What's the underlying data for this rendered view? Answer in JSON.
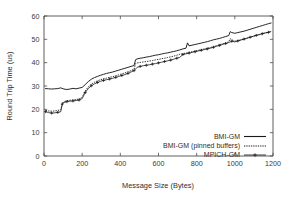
{
  "chart_data": {
    "type": "line",
    "title": "",
    "xlabel": "Message Size (Bytes)",
    "ylabel": "Round Trip Time (us)",
    "xlim": [
      0,
      1200
    ],
    "ylim": [
      0,
      60
    ],
    "xticks": [
      0,
      200,
      400,
      600,
      800,
      1000,
      1200
    ],
    "yticks": [
      0,
      10,
      20,
      30,
      40,
      50,
      60
    ],
    "xtick_labels": [
      "0",
      "200",
      "400",
      "600",
      "800",
      "1000",
      "1200"
    ],
    "ytick_labels": [
      "0",
      "10",
      "20",
      "30",
      "40",
      "50",
      "60"
    ],
    "grid": false,
    "legend_position": "lower right",
    "series": [
      {
        "name": "BMI-GM",
        "style": "solid",
        "marker": "none",
        "x": [
          8,
          24,
          40,
          56,
          72,
          88,
          104,
          120,
          136,
          152,
          168,
          184,
          200,
          216,
          232,
          248,
          264,
          280,
          296,
          312,
          328,
          344,
          360,
          376,
          392,
          408,
          424,
          440,
          456,
          472,
          480,
          488,
          504,
          520,
          536,
          552,
          568,
          584,
          600,
          616,
          632,
          648,
          664,
          680,
          696,
          712,
          728,
          744,
          752,
          760,
          776,
          792,
          808,
          824,
          840,
          856,
          872,
          888,
          904,
          920,
          936,
          952,
          968,
          976,
          984,
          1000,
          1016,
          1032,
          1048,
          1064,
          1080,
          1096,
          1112,
          1128,
          1144,
          1160,
          1176,
          1190
        ],
        "y": [
          28.9,
          28.8,
          28.7,
          28.8,
          28.9,
          29.2,
          28.7,
          28.5,
          28.7,
          29.0,
          28.8,
          29.1,
          29.4,
          30.6,
          31.9,
          32.9,
          33.6,
          34.1,
          34.6,
          35.0,
          35.4,
          35.7,
          36.0,
          36.4,
          36.8,
          37.2,
          37.6,
          38.0,
          38.4,
          38.8,
          41.3,
          41.6,
          41.9,
          42.1,
          42.4,
          42.6,
          42.9,
          43.2,
          43.4,
          43.7,
          44.0,
          44.2,
          44.5,
          44.8,
          45.1,
          45.5,
          45.9,
          46.2,
          48.5,
          47.2,
          47.5,
          47.8,
          48.1,
          48.4,
          48.7,
          49.0,
          49.4,
          49.8,
          50.1,
          50.4,
          50.8,
          51.2,
          51.6,
          53.3,
          52.9,
          52.6,
          52.9,
          53.2,
          53.5,
          53.9,
          54.3,
          54.7,
          55.1,
          55.5,
          55.9,
          56.3,
          56.7,
          57.0
        ]
      },
      {
        "name": "BMI-GM (pinned buffers)",
        "style": "dotted",
        "marker": "none",
        "x": [
          8,
          24,
          40,
          56,
          72,
          88,
          96,
          104,
          120,
          136,
          152,
          168,
          184,
          200,
          216,
          232,
          248,
          264,
          280,
          296,
          312,
          328,
          344,
          360,
          376,
          392,
          408,
          424,
          440,
          456,
          472,
          480,
          488,
          504,
          520,
          536,
          552,
          568,
          584,
          600,
          616,
          632,
          648,
          664,
          680,
          696,
          712,
          728,
          744,
          760,
          776,
          792,
          808,
          824,
          840,
          856,
          872,
          888,
          904,
          920,
          936,
          952,
          968,
          976,
          984,
          1000,
          1016,
          1032,
          1048,
          1064,
          1080,
          1096,
          1112,
          1128,
          1144,
          1160,
          1176,
          1190
        ],
        "y": [
          19.6,
          19.3,
          19.2,
          19.3,
          19.5,
          19.9,
          22.6,
          23.3,
          23.7,
          23.9,
          24.0,
          24.2,
          24.4,
          25.2,
          27.9,
          29.6,
          30.8,
          31.6,
          32.2,
          32.7,
          33.1,
          33.4,
          33.7,
          34.0,
          34.4,
          34.8,
          35.2,
          35.6,
          36.1,
          36.6,
          37.2,
          39.6,
          39.9,
          40.1,
          40.3,
          40.5,
          40.7,
          40.9,
          41.2,
          41.4,
          41.7,
          41.9,
          42.2,
          42.5,
          42.8,
          43.2,
          43.6,
          43.9,
          44.1,
          44.4,
          44.7,
          45.0,
          45.3,
          45.6,
          45.9,
          46.2,
          46.5,
          46.9,
          47.3,
          47.7,
          48.1,
          48.5,
          48.9,
          50.3,
          49.8,
          49.2,
          49.5,
          49.8,
          50.1,
          50.5,
          50.9,
          51.3,
          51.7,
          52.1,
          52.5,
          52.8,
          53.1,
          53.4
        ]
      },
      {
        "name": "MPICH-GM",
        "style": "solid-with-markers",
        "marker": "plus",
        "x": [
          8,
          24,
          40,
          56,
          72,
          88,
          96,
          104,
          120,
          136,
          152,
          168,
          184,
          200,
          216,
          232,
          248,
          264,
          280,
          296,
          312,
          328,
          344,
          360,
          376,
          392,
          408,
          424,
          440,
          456,
          472,
          488,
          504,
          520,
          536,
          552,
          568,
          584,
          600,
          616,
          632,
          648,
          664,
          680,
          696,
          712,
          728,
          744,
          760,
          776,
          792,
          808,
          824,
          840,
          856,
          872,
          888,
          904,
          920,
          936,
          952,
          968,
          984,
          1000,
          1016,
          1032,
          1048,
          1064,
          1080,
          1096,
          1112,
          1128,
          1144,
          1160,
          1176,
          1190
        ],
        "y": [
          19.0,
          18.6,
          18.4,
          18.5,
          18.7,
          19.0,
          22.3,
          22.9,
          23.3,
          23.5,
          23.6,
          23.8,
          24.0,
          24.6,
          27.2,
          28.9,
          30.1,
          30.9,
          31.5,
          32.0,
          32.4,
          32.7,
          33.0,
          33.3,
          33.7,
          34.1,
          34.5,
          34.9,
          35.4,
          36.0,
          36.6,
          38.0,
          38.4,
          38.7,
          38.9,
          39.1,
          39.4,
          39.6,
          39.9,
          40.2,
          40.5,
          40.8,
          41.1,
          41.5,
          41.9,
          42.3,
          43.5,
          43.8,
          44.1,
          44.4,
          44.7,
          45.0,
          45.3,
          45.6,
          45.9,
          46.2,
          46.6,
          47.0,
          47.4,
          47.8,
          48.2,
          48.6,
          49.2,
          48.9,
          49.3,
          49.7,
          50.1,
          50.5,
          50.9,
          51.3,
          51.7,
          52.0,
          52.4,
          52.7,
          53.0,
          53.3
        ]
      }
    ]
  },
  "legend": {
    "entries": [
      {
        "label": "BMI-GM",
        "style": "solid"
      },
      {
        "label": "BMI-GM (pinned buffers)",
        "style": "dotted"
      },
      {
        "label": "MPICH-GM",
        "style": "plus"
      }
    ]
  }
}
